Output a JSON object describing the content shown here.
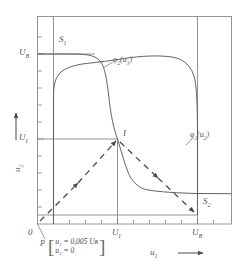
{
  "figure": {
    "title": "",
    "axes": {
      "x": {
        "label": "u1",
        "label_sub": "1",
        "arrow": "→"
      },
      "y": {
        "label": "u2",
        "label_sub": "2",
        "arrow": "→"
      }
    },
    "tick_labels": {
      "x": [
        {
          "text": "0",
          "sub": "",
          "value": 0
        },
        {
          "text": "U",
          "sub": "I",
          "value": 0.5
        },
        {
          "text": "U",
          "sub": "B",
          "value": 1.0
        }
      ],
      "y": [
        {
          "text": "U",
          "sub": "I",
          "value": 0.5
        },
        {
          "text": "U",
          "sub": "B",
          "value": 1.0
        }
      ]
    },
    "curve_labels": [
      {
        "name": "phi2",
        "text": "φ",
        "sub": "2",
        "arg": "(u",
        "arg_sub": "1",
        "arg_close": ")"
      },
      {
        "name": "phi1",
        "text": "φ",
        "sub": "1",
        "arg": "(u",
        "arg_sub": "2",
        "arg_close": ")"
      }
    ],
    "point_labels": [
      {
        "name": "S1",
        "text": "S",
        "sub": "1"
      },
      {
        "name": "S2",
        "text": "S",
        "sub": "2"
      },
      {
        "name": "I",
        "text": "I",
        "sub": ""
      },
      {
        "name": "P",
        "text": "P",
        "sub": ""
      }
    ],
    "annotation": {
      "anchor": "P",
      "lines": [
        "u₁ = 0,005 Uʙ",
        "u₂ = 0"
      ],
      "line1": "u₁ = 0,005 Uʙ",
      "line2": "u₂ = 0",
      "bracket_left": "[",
      "bracket_right": "]"
    },
    "colors": {
      "line": "#5b5b5b",
      "frame": "#6e6e6e",
      "text": "#4a4a4a"
    }
  },
  "chart_data": {
    "type": "line",
    "title": "",
    "xlabel": "u1",
    "ylabel": "u2",
    "xlim": [
      0,
      1.2
    ],
    "ylim": [
      0,
      1.2
    ],
    "grid": false,
    "legend": "inline-curve-labels",
    "xticks": [
      0,
      0.1,
      0.2,
      0.3,
      0.4,
      0.5,
      0.6,
      0.7,
      0.8,
      0.9,
      1.0,
      1.1
    ],
    "yticks": [
      0,
      0.1,
      0.2,
      0.3,
      0.4,
      0.5,
      0.6,
      0.7,
      0.8,
      0.9,
      1.0,
      1.1
    ],
    "xtick_labels": {
      "0": "0",
      "0.5": "U_I",
      "1.0": "U_B"
    },
    "ytick_labels": {
      "0.5": "U_I",
      "1.0": "U_B"
    },
    "series": [
      {
        "name": "phi2(u1)",
        "label": "φ2(u1)",
        "style": "solid",
        "description": "Inverse-S transfer characteristic of stage 2: high output U_B for small u1, steep fall near U_I, low output for large u1",
        "points": [
          [
            0.055,
            1.0
          ],
          [
            0.2,
            1.0
          ],
          [
            0.3,
            0.995
          ],
          [
            0.38,
            0.985
          ],
          [
            0.44,
            0.95
          ],
          [
            0.47,
            0.88
          ],
          [
            0.49,
            0.74
          ],
          [
            0.5,
            0.55
          ],
          [
            0.515,
            0.36
          ],
          [
            0.535,
            0.22
          ],
          [
            0.56,
            0.13
          ],
          [
            0.6,
            0.075
          ],
          [
            0.68,
            0.055
          ],
          [
            0.82,
            0.047
          ],
          [
            1.0,
            0.045
          ],
          [
            1.1,
            0.045
          ]
        ]
      },
      {
        "name": "phi1(u2)",
        "label": "φ1(u2)",
        "style": "solid",
        "description": "Transfer characteristic of stage 1 plotted as u2 vs u1 (mirrored): high u2 region at low u1, gradual decline through I, steep drop near U_B",
        "points": [
          [
            0.055,
            1.0
          ],
          [
            0.057,
            0.86
          ],
          [
            0.062,
            0.74
          ],
          [
            0.075,
            0.66
          ],
          [
            0.1,
            0.615
          ],
          [
            0.16,
            0.585
          ],
          [
            0.26,
            0.555
          ],
          [
            0.38,
            0.525
          ],
          [
            0.5,
            0.5
          ],
          [
            0.62,
            0.465
          ],
          [
            0.74,
            0.425
          ],
          [
            0.84,
            0.375
          ],
          [
            0.92,
            0.31
          ],
          [
            0.965,
            0.23
          ],
          [
            0.985,
            0.145
          ],
          [
            0.995,
            0.085
          ],
          [
            1.0,
            0.055
          ],
          [
            1.0,
            0.045
          ]
        ]
      },
      {
        "name": "trajectory",
        "label": "switching trajectory",
        "style": "dashed-arrow",
        "description": "Dashed trajectory with arrowheads: from operating point P near origin up to unstable point I, then down to stable point S2",
        "points": [
          [
            0.02,
            0.02
          ],
          [
            0.26,
            0.26
          ],
          [
            0.5,
            0.5
          ],
          [
            0.75,
            0.275
          ],
          [
            1.0,
            0.048
          ]
        ]
      }
    ],
    "markers": [
      {
        "name": "S1",
        "label": "S1",
        "x": 0.1,
        "y": 1.0,
        "note": "stable state 1 (u1 low, u2 = U_B)"
      },
      {
        "name": "S2",
        "label": "S2",
        "x": 1.0,
        "y": 0.048,
        "note": "stable state 2 (u1 = U_B, u2 low)"
      },
      {
        "name": "I",
        "label": "I",
        "x": 0.5,
        "y": 0.5,
        "note": "unstable intersection point at (U_I, U_I)"
      },
      {
        "name": "P",
        "label": "P",
        "x": 0.02,
        "y": 0.0,
        "note": "start point, u1 = 0,005 U_B, u2 = 0"
      }
    ],
    "annotations": [
      {
        "target": "P",
        "text": "u1 = 0,005 U_B ; u2 = 0"
      }
    ],
    "guide_lines": [
      {
        "name": "UB-horizontal",
        "from": [
          0,
          1.0
        ],
        "to": [
          0.3,
          1.0
        ]
      },
      {
        "name": "UI-horizontal",
        "from": [
          0,
          0.5
        ],
        "to": [
          0.5,
          0.5
        ]
      },
      {
        "name": "S2-horizontal",
        "from": [
          0,
          0.048
        ],
        "to": [
          1.0,
          0.048
        ]
      },
      {
        "name": "S1-vertical",
        "from": [
          0.055,
          0
        ],
        "to": [
          0.055,
          1.12
        ]
      },
      {
        "name": "UI-vertical",
        "from": [
          0.5,
          0
        ],
        "to": [
          0.5,
          0.5
        ]
      },
      {
        "name": "UB-vertical",
        "from": [
          1.0,
          0
        ],
        "to": [
          1.0,
          1.12
        ]
      }
    ]
  }
}
